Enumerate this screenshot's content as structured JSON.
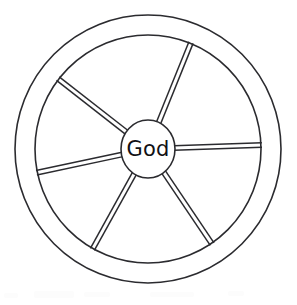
{
  "figure": {
    "background_color": "#ffffff",
    "stroke_color": "#2b2b2f",
    "hub_fill_color": "#ffffff",
    "text_color": "#111114",
    "width": 297,
    "height": 305
  },
  "wheel": {
    "center": {
      "x": 148,
      "y": 149
    },
    "outer_rim": {
      "name": "outer-rim-circle",
      "rx": 133,
      "ry": 134,
      "stroke_width": 1.6
    },
    "inner_rim": {
      "name": "inner-rim-circle",
      "rx": 113,
      "ry": 114,
      "stroke_width": 1.6
    },
    "hub": {
      "name": "hub-ellipse",
      "rx": 27,
      "ry": 29,
      "stroke_width": 1.6,
      "label": "God"
    },
    "spoke_stroke_width": 1.5,
    "spoke_pair_offset": 4.5,
    "spokes": [
      {
        "name": "spoke-upper-right",
        "angle_deg": -68,
        "label": "upper right spoke"
      },
      {
        "name": "spoke-right",
        "angle_deg": -2,
        "label": "right spoke"
      },
      {
        "name": "spoke-lower-right",
        "angle_deg": 56,
        "label": "lower right spoke"
      },
      {
        "name": "spoke-lower-left",
        "angle_deg": 119,
        "label": "lower left spoke"
      },
      {
        "name": "spoke-left",
        "angle_deg": 168,
        "label": "left spoke"
      },
      {
        "name": "spoke-upper-left",
        "angle_deg": -142,
        "label": "upper left spoke"
      }
    ]
  },
  "artifacts": [
    {
      "name": "scan-smudge",
      "x": 4,
      "y": 293,
      "w": 14,
      "h": 5
    },
    {
      "name": "scan-smudge",
      "x": 34,
      "y": 291,
      "w": 40,
      "h": 7
    },
    {
      "name": "scan-smudge",
      "x": 84,
      "y": 292,
      "w": 26,
      "h": 5
    },
    {
      "name": "scan-smudge",
      "x": 150,
      "y": 292,
      "w": 44,
      "h": 5
    },
    {
      "name": "scan-smudge",
      "x": 228,
      "y": 291,
      "w": 16,
      "h": 5
    }
  ]
}
